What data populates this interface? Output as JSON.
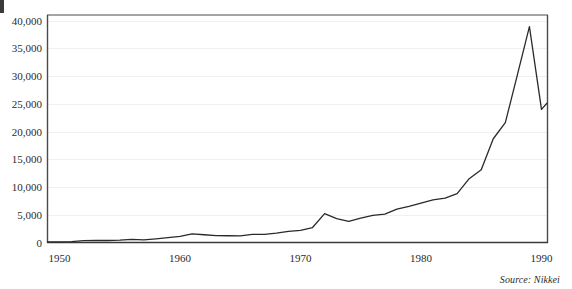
{
  "figure": {
    "source_note": "Source: Nikkei",
    "background_color": "#ffffff",
    "line_color": "#2a2a2a",
    "frame_color": "#4a4a4a",
    "grid_color": "#f0f0f0"
  },
  "chart_data": {
    "type": "line",
    "title": "",
    "xlabel": "",
    "ylabel": "",
    "xlim": [
      1949,
      1990.5
    ],
    "ylim": [
      0,
      41000
    ],
    "grid": true,
    "legend": false,
    "xticks": [
      1950,
      1960,
      1970,
      1980,
      1990
    ],
    "xtick_labels": [
      "1950",
      "1960",
      "1970",
      "1980",
      "1990"
    ],
    "yticks": [
      0,
      5000,
      10000,
      15000,
      20000,
      25000,
      30000,
      35000,
      40000
    ],
    "ytick_labels": [
      "0",
      "5,000",
      "10,000",
      "15,000",
      "20,000",
      "25,000",
      "30,000",
      "35,000",
      "40,000"
    ],
    "series": [
      {
        "name": "Nikkei 225",
        "x": [
          1949,
          1950,
          1951,
          1952,
          1953,
          1954,
          1955,
          1956,
          1957,
          1958,
          1959,
          1960,
          1961,
          1962,
          1963,
          1964,
          1965,
          1966,
          1967,
          1968,
          1969,
          1970,
          1971,
          1972,
          1973,
          1974,
          1975,
          1976,
          1977,
          1978,
          1979,
          1980,
          1981,
          1982,
          1983,
          1984,
          1985,
          1986,
          1987,
          1988,
          1989,
          1990
        ],
        "values": [
          110,
          100,
          170,
          330,
          380,
          360,
          420,
          550,
          480,
          670,
          880,
          1100,
          1550,
          1400,
          1250,
          1220,
          1200,
          1450,
          1450,
          1700,
          2000,
          2200,
          2700,
          5200,
          4300,
          3800,
          4400,
          4900,
          5100,
          6000,
          6500,
          7100,
          7700,
          8000,
          8800,
          11500,
          13100,
          18700,
          21600,
          30200,
          38900,
          24000
        ],
        "end_value_label": "25,000"
      }
    ],
    "annotations": []
  }
}
